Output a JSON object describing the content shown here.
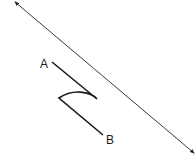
{
  "diagram": {
    "type": "geometry-figure",
    "labels": {
      "point_a": "A",
      "point_b": "B"
    },
    "colors": {
      "background": "#ffffff",
      "line": "#3a3a3a",
      "path": "#1a1a1a"
    },
    "elements": [
      {
        "name": "line-with-arrows",
        "description": "Long straight line with arrowheads at both ends"
      },
      {
        "name": "path-a-to-b",
        "description": "Broken path from A to B with a curved bend"
      }
    ]
  }
}
